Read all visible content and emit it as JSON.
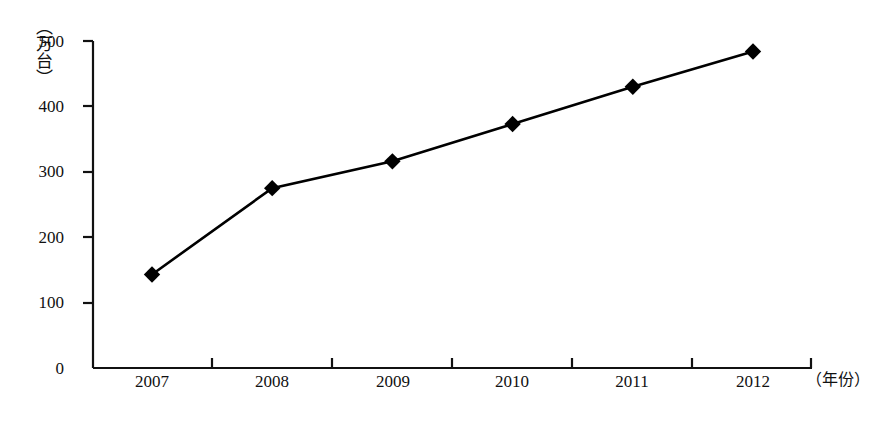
{
  "chart_data": {
    "type": "line",
    "title": "",
    "subtitle": "",
    "xlabel": "（年份）",
    "ylabel": "（万台）",
    "categories": [
      "2007",
      "2008",
      "2009",
      "2010",
      "2011",
      "2012"
    ],
    "x": [
      2007,
      2008,
      2009,
      2010,
      2011,
      2012
    ],
    "values": [
      143,
      275,
      316,
      373,
      430,
      484
    ],
    "series": [
      {
        "name": "",
        "values": [
          143,
          275,
          316,
          373,
          430,
          484
        ],
        "marker": "diamond",
        "color": "#000000",
        "line_width": 2.4
      }
    ],
    "ylim": [
      0,
      500
    ],
    "yticks": [
      0,
      100,
      200,
      300,
      400,
      500
    ],
    "ytick_labels": [
      "0",
      "100",
      "200",
      "300",
      "400",
      "500"
    ],
    "xtick_labels": [
      "2007",
      "2008",
      "2009",
      "2010",
      "2011",
      "2012"
    ],
    "grid": false,
    "legend": "none",
    "axis_color": "#111111",
    "background": "#ffffff"
  },
  "axes": {
    "y_title": "（万台）",
    "x_title": "（年份）",
    "y_labels": [
      "500",
      "400",
      "300",
      "200",
      "100",
      "0"
    ],
    "x_labels": [
      "2007",
      "2008",
      "2009",
      "2010",
      "2011",
      "2012"
    ]
  }
}
